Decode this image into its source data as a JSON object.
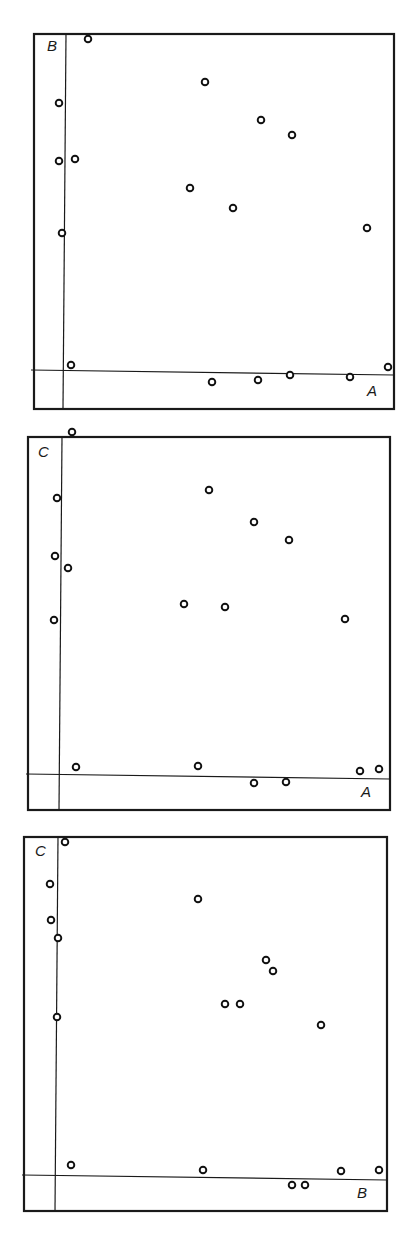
{
  "chart_data": [
    {
      "type": "scatter",
      "title": "",
      "xlabel": "A",
      "ylabel": "B",
      "grid": false,
      "legend": "none",
      "frame_px": {
        "left": 34,
        "top": 34,
        "width": 360,
        "height": 375
      },
      "axis_origin_px": {
        "x": 32,
        "y": 338
      },
      "points_px": [
        [
          54,
          5
        ],
        [
          25,
          69
        ],
        [
          25,
          127
        ],
        [
          41,
          125
        ],
        [
          28,
          199
        ],
        [
          37,
          331
        ],
        [
          171,
          48
        ],
        [
          227,
          86
        ],
        [
          258,
          101
        ],
        [
          156,
          154
        ],
        [
          199,
          174
        ],
        [
          333,
          194
        ],
        [
          178,
          348
        ],
        [
          224,
          346
        ],
        [
          256,
          341
        ],
        [
          316,
          343
        ],
        [
          354,
          333
        ]
      ],
      "points_normalized": [
        [
          0.07,
          0.99
        ],
        [
          -0.02,
          0.8
        ],
        [
          -0.02,
          0.63
        ],
        [
          0.03,
          0.63
        ],
        [
          -0.01,
          0.41
        ],
        [
          0.02,
          0.02
        ],
        [
          0.42,
          0.86
        ],
        [
          0.6,
          0.75
        ],
        [
          0.69,
          0.7
        ],
        [
          0.38,
          0.54
        ],
        [
          0.51,
          0.49
        ],
        [
          0.92,
          0.43
        ],
        [
          0.45,
          -0.03
        ],
        [
          0.59,
          -0.02
        ],
        [
          0.68,
          -0.01
        ],
        [
          0.86,
          -0.01
        ],
        [
          0.98,
          0.01
        ]
      ]
    },
    {
      "type": "scatter",
      "title": "",
      "xlabel": "A",
      "ylabel": "C",
      "grid": false,
      "legend": "none",
      "frame_px": {
        "left": 28,
        "top": 437,
        "width": 362,
        "height": 373
      },
      "axis_origin_px": {
        "x": 33,
        "y": 339
      },
      "points_px": [
        [
          44,
          -5
        ],
        [
          29,
          61
        ],
        [
          27,
          119
        ],
        [
          40,
          131
        ],
        [
          26,
          183
        ],
        [
          48,
          330
        ],
        [
          170,
          329
        ],
        [
          226,
          346
        ],
        [
          258,
          345
        ],
        [
          332,
          334
        ],
        [
          351,
          332
        ],
        [
          181,
          53
        ],
        [
          226,
          85
        ],
        [
          261,
          103
        ],
        [
          156,
          167
        ],
        [
          197,
          170
        ],
        [
          317,
          182
        ]
      ],
      "points_normalized": [
        [
          0.03,
          1.01
        ],
        [
          -0.01,
          0.82
        ],
        [
          -0.02,
          0.65
        ],
        [
          0.02,
          0.62
        ],
        [
          -0.02,
          0.46
        ],
        [
          0.05,
          0.03
        ],
        [
          0.42,
          0.03
        ],
        [
          0.59,
          -0.02
        ],
        [
          0.69,
          -0.02
        ],
        [
          0.91,
          0.01
        ],
        [
          0.97,
          0.02
        ],
        [
          0.45,
          0.84
        ],
        [
          0.59,
          0.75
        ],
        [
          0.69,
          0.7
        ],
        [
          0.37,
          0.51
        ],
        [
          0.5,
          0.5
        ],
        [
          0.86,
          0.46
        ]
      ]
    },
    {
      "type": "scatter",
      "title": "",
      "xlabel": "B",
      "ylabel": "C",
      "grid": false,
      "legend": "none",
      "frame_px": {
        "left": 24,
        "top": 837,
        "width": 363,
        "height": 374
      },
      "axis_origin_px": {
        "x": 33,
        "y": 340
      },
      "points_px": [
        [
          41,
          5
        ],
        [
          26,
          47
        ],
        [
          27,
          83
        ],
        [
          34,
          101
        ],
        [
          33,
          180
        ],
        [
          47,
          328
        ],
        [
          179,
          333
        ],
        [
          174,
          62
        ],
        [
          242,
          123
        ],
        [
          249,
          134
        ],
        [
          201,
          167
        ],
        [
          216,
          167
        ],
        [
          297,
          188
        ],
        [
          268,
          348
        ],
        [
          281,
          348
        ],
        [
          317,
          334
        ],
        [
          355,
          333
        ]
      ],
      "points_normalized": [
        [
          0.02,
          0.99
        ],
        [
          -0.02,
          0.86
        ],
        [
          -0.02,
          0.76
        ],
        [
          0.0,
          0.7
        ],
        [
          0.0,
          0.47
        ],
        [
          0.04,
          0.04
        ],
        [
          0.44,
          0.02
        ],
        [
          0.42,
          0.82
        ],
        [
          0.63,
          0.64
        ],
        [
          0.65,
          0.61
        ],
        [
          0.51,
          0.51
        ],
        [
          0.55,
          0.51
        ],
        [
          0.8,
          0.45
        ],
        [
          0.71,
          -0.02
        ],
        [
          0.75,
          -0.02
        ],
        [
          0.86,
          0.02
        ],
        [
          0.98,
          0.02
        ]
      ]
    }
  ],
  "panels": [
    {
      "x_label": "A",
      "y_label": "B"
    },
    {
      "x_label": "A",
      "y_label": "C"
    },
    {
      "x_label": "B",
      "y_label": "C"
    }
  ]
}
